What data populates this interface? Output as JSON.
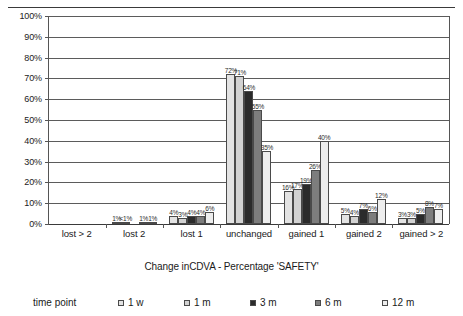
{
  "chart_data": {
    "type": "bar",
    "title": "",
    "xlabel": "Change inCDVA - Percentage 'SAFETY'",
    "ylabel": "",
    "ylim": [
      0,
      100
    ],
    "ytick_labels": [
      "100%",
      "90%",
      "80%",
      "70%",
      "60%",
      "50%",
      "40%",
      "30%",
      "20%",
      "10%",
      "0%"
    ],
    "ytick_values": [
      100,
      90,
      80,
      70,
      60,
      50,
      40,
      30,
      20,
      10,
      0
    ],
    "grid": true,
    "legend_position": "bottom",
    "legend_title": "time point",
    "categories": [
      "lost > 2",
      "lost 2",
      "lost 1",
      "unchanged",
      "gained 1",
      "gained 2",
      "gained > 2"
    ],
    "series": [
      {
        "name": "1 w",
        "color": "#e3e3e3",
        "values": [
          0,
          1,
          4,
          72,
          16,
          5,
          3
        ],
        "labels": [
          "",
          "1%",
          "4%",
          "72%",
          "16%",
          "5%",
          "3%"
        ]
      },
      {
        "name": "1 m",
        "color": "#d2d2d2",
        "values": [
          0,
          0.5,
          3,
          71,
          17,
          4,
          3
        ],
        "labels": [
          "",
          "<1%",
          "3%",
          "71%",
          "17%",
          "4%",
          "3%"
        ]
      },
      {
        "name": "3 m",
        "color": "#2b2b2b",
        "values": [
          0,
          0,
          4,
          64,
          19,
          7,
          5
        ],
        "labels": [
          "",
          "",
          "4%",
          "64%",
          "19%",
          "7%",
          "5%"
        ]
      },
      {
        "name": "6 m",
        "color": "#7d7d7d",
        "values": [
          0,
          1,
          4,
          55,
          26,
          6,
          8
        ],
        "labels": [
          "",
          "1%",
          "4%",
          "55%",
          "26%",
          "6%",
          "8%"
        ]
      },
      {
        "name": "12 m",
        "color": "#ededed",
        "values": [
          0,
          1,
          6,
          35,
          40,
          12,
          7
        ],
        "labels": [
          "",
          "1%",
          "6%",
          "35%",
          "40%",
          "12%",
          "7%"
        ]
      }
    ]
  }
}
